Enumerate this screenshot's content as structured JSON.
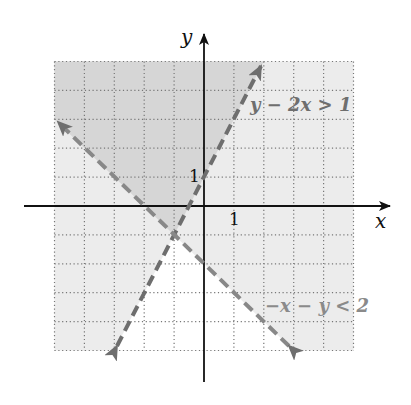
{
  "figure": {
    "type": "inequality-graph",
    "axes": {
      "x_label": "x",
      "y_label": "y",
      "x_tick_label": "1",
      "y_tick_label": "1",
      "xlim": [
        -5,
        5
      ],
      "ylim": [
        -5,
        5
      ],
      "grid": "dotted, 1 unit"
    },
    "inequalities": [
      {
        "label": "y − 2x > 1",
        "boundary": "y = 2x + 1",
        "style": "dashed",
        "from": [
          -3,
          -5
        ],
        "to": [
          2,
          5
        ]
      },
      {
        "label": "−x − y < 2",
        "boundary": "y = −x − 2",
        "style": "dashed",
        "from": [
          3,
          -5
        ],
        "to": [
          -5,
          3
        ]
      }
    ],
    "intersection_point": [
      -1,
      -1
    ],
    "colors": {
      "both_region": "#d6d6d6",
      "one_region": "#ececec",
      "none_region": "#ffffff",
      "line": "#6e6e6e",
      "label_gray": "#7a7a7a",
      "axis": "#111111",
      "grid_dot": "#777777"
    }
  }
}
